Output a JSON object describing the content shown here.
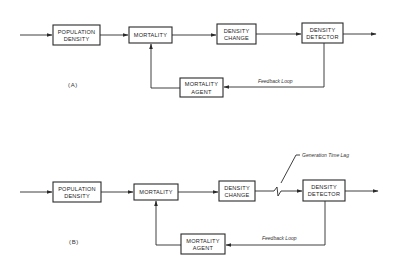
{
  "diagram": {
    "panels": [
      {
        "id": "A",
        "label": "(A)",
        "blocks": {
          "population_density": [
            "POPULATION",
            "DENSITY"
          ],
          "mortality": [
            "MORTALITY"
          ],
          "density_change": [
            "DENSITY",
            "CHANGE"
          ],
          "density_detector": [
            "DENSITY",
            "DETECTOR"
          ],
          "mortality_agent": [
            "MORTALITY",
            "AGENT"
          ]
        },
        "feedback_label": "Feedback Loop"
      },
      {
        "id": "B",
        "label": "(B)",
        "blocks": {
          "population_density": [
            "POPULATION",
            "DENSITY"
          ],
          "mortality": [
            "MORTALITY"
          ],
          "density_change": [
            "DENSITY",
            "CHANGE"
          ],
          "density_detector": [
            "DENSITY",
            "DETECTOR"
          ],
          "mortality_agent": [
            "MORTALITY",
            "AGENT"
          ]
        },
        "feedback_label": "Feedback Loop",
        "lag_label": "Generation Time Lag"
      }
    ],
    "edges": [
      "input -> POPULATION DENSITY",
      "POPULATION DENSITY -> MORTALITY",
      "MORTALITY -> DENSITY CHANGE",
      "DENSITY CHANGE -> DENSITY DETECTOR",
      "DENSITY DETECTOR -> output",
      "DENSITY DETECTOR -> MORTALITY AGENT (feedback)",
      "MORTALITY AGENT -> MORTALITY"
    ],
    "colors": {
      "ink": "#2a2a2a",
      "background": "#ffffff"
    }
  }
}
